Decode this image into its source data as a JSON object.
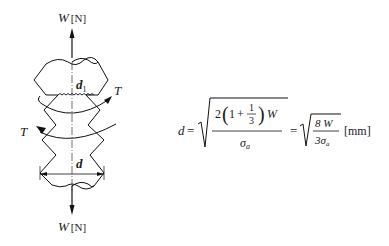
{
  "diagram": {
    "top_load": {
      "symbol": "W",
      "unit": "[N]"
    },
    "bottom_load": {
      "symbol": "W",
      "unit": "[N]"
    },
    "torque_right": "T",
    "torque_left": "T",
    "root_diameter": {
      "symbol": "d",
      "subscript": "1"
    },
    "outer_diameter": "d"
  },
  "formula": {
    "lhs": "d",
    "equals1": "=",
    "numerator_coef": "2",
    "paren_open": "(",
    "one": "1",
    "plus": "+",
    "frac_num": "1",
    "frac_den": "3",
    "paren_close": ")",
    "W": "W",
    "denominator": "σ",
    "denominator_sub": "a",
    "equals2": "=",
    "num2": "8 W",
    "den2_coef": "3σ",
    "den2_sub": "a",
    "unit": "[mm]"
  }
}
